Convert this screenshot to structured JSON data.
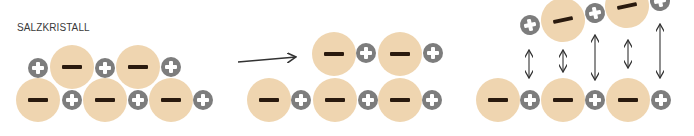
{
  "title": "SALZKRISTALL",
  "colors": {
    "anion_fill": "#efd5b0",
    "anion_sign": "#2a1a0e",
    "cation_fill": "#7d7d7d",
    "cation_sign": "#ffffff",
    "arrow": "#333333"
  },
  "legend": {
    "anion_symbol": "−",
    "cation_symbol": "+"
  },
  "panels": [
    {
      "name": "salt-crystal",
      "ions": [
        {
          "type": "cation",
          "x": 38,
          "y": 68,
          "rot": 0
        },
        {
          "type": "anion",
          "x": 72,
          "y": 67,
          "rot": 0
        },
        {
          "type": "cation",
          "x": 105,
          "y": 68,
          "rot": 0
        },
        {
          "type": "anion",
          "x": 138,
          "y": 67,
          "rot": 0
        },
        {
          "type": "cation",
          "x": 171,
          "y": 67,
          "rot": 0
        },
        {
          "type": "anion",
          "x": 38,
          "y": 100,
          "rot": 0
        },
        {
          "type": "cation",
          "x": 72,
          "y": 100,
          "rot": 0
        },
        {
          "type": "anion",
          "x": 105,
          "y": 100,
          "rot": 0
        },
        {
          "type": "cation",
          "x": 138,
          "y": 100,
          "rot": 0
        },
        {
          "type": "anion",
          "x": 171,
          "y": 100,
          "rot": 0
        },
        {
          "type": "cation",
          "x": 203,
          "y": 100,
          "rot": 0
        }
      ]
    },
    {
      "name": "shifted-layer",
      "ions": [
        {
          "type": "anion",
          "x": 334,
          "y": 54,
          "rot": 0
        },
        {
          "type": "cation",
          "x": 366,
          "y": 53,
          "rot": 0
        },
        {
          "type": "anion",
          "x": 400,
          "y": 54,
          "rot": 0
        },
        {
          "type": "cation",
          "x": 433,
          "y": 53,
          "rot": 0
        },
        {
          "type": "anion",
          "x": 269,
          "y": 100,
          "rot": 0
        },
        {
          "type": "cation",
          "x": 301,
          "y": 100,
          "rot": 0
        },
        {
          "type": "anion",
          "x": 335,
          "y": 100,
          "rot": 0
        },
        {
          "type": "cation",
          "x": 368,
          "y": 100,
          "rot": 0
        },
        {
          "type": "anion",
          "x": 400,
          "y": 100,
          "rot": 0
        },
        {
          "type": "cation",
          "x": 432,
          "y": 100,
          "rot": 0
        }
      ]
    },
    {
      "name": "repulsion",
      "ions": [
        {
          "type": "cation",
          "x": 530,
          "y": 25,
          "rot": -12
        },
        {
          "type": "anion",
          "x": 563,
          "y": 20,
          "rot": -12
        },
        {
          "type": "cation",
          "x": 595,
          "y": 13,
          "rot": -12
        },
        {
          "type": "anion",
          "x": 627,
          "y": 6,
          "rot": -12
        },
        {
          "type": "cation",
          "x": 660,
          "y": 1,
          "rot": -12
        },
        {
          "type": "anion",
          "x": 498,
          "y": 100,
          "rot": 0
        },
        {
          "type": "cation",
          "x": 530,
          "y": 100,
          "rot": 0
        },
        {
          "type": "anion",
          "x": 563,
          "y": 100,
          "rot": 0
        },
        {
          "type": "cation",
          "x": 595,
          "y": 100,
          "rot": 0
        },
        {
          "type": "anion",
          "x": 628,
          "y": 100,
          "rot": 0
        },
        {
          "type": "cation",
          "x": 661,
          "y": 100,
          "rot": 0
        }
      ]
    }
  ],
  "arrows": {
    "shift": {
      "x1": 238,
      "y1": 62,
      "x2": 296,
      "y2": 57
    },
    "double": [
      {
        "x": 529,
        "y1": 50,
        "y2": 78
      },
      {
        "x": 563,
        "y1": 50,
        "y2": 72
      },
      {
        "x": 595,
        "y1": 35,
        "y2": 80
      },
      {
        "x": 628,
        "y1": 40,
        "y2": 68
      },
      {
        "x": 660,
        "y1": 24,
        "y2": 78
      }
    ]
  }
}
